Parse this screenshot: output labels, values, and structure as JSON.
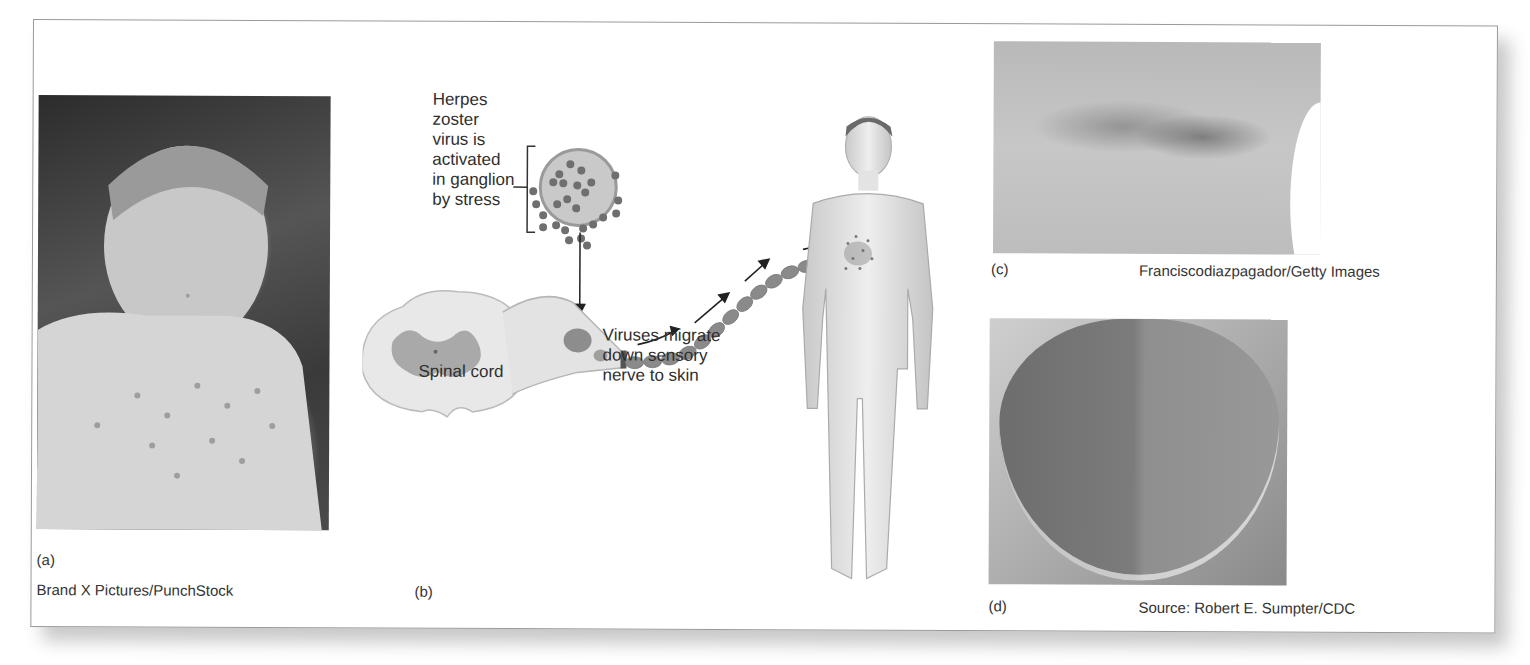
{
  "figure": {
    "panel_a": {
      "label": "(a)",
      "credit": "Brand X Pictures/PunchStock",
      "image_description": "Crying child with chickenpox rash on chest"
    },
    "panel_b": {
      "label": "(b)",
      "annotation_virus_activation": [
        "Herpes",
        "zoster",
        "virus is",
        "activated",
        "in ganglion",
        "by stress"
      ],
      "annotation_spinal_cord": "Spinal cord",
      "annotation_migration": [
        "Viruses migrate",
        "down sensory",
        "nerve to skin"
      ]
    },
    "panel_c": {
      "label": "(c)",
      "credit": "Franciscodiazpagador/Getty Images",
      "image_description": "Shingles rash on torso"
    },
    "panel_d": {
      "label": "(d)",
      "credit": "Source: Robert E. Sumpter/CDC",
      "image_description": "Tongue with herpes zoster lesions on one side"
    }
  },
  "colors": {
    "border": "#9a9a9a",
    "text": "#2b2b2b",
    "virus_dot": "#6f6f6f",
    "diagram_fill": "#e6e6e6"
  }
}
